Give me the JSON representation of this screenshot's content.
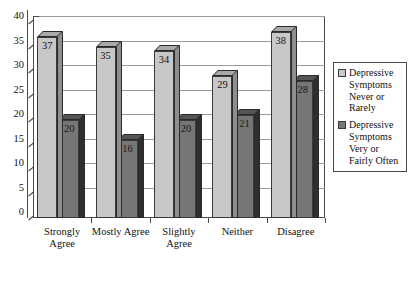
{
  "chart_data": {
    "type": "bar",
    "title": "",
    "subtitle": "",
    "xlabel": "",
    "ylabel": "",
    "ylim": [
      0,
      40
    ],
    "ytick_step": 5,
    "yticks": [
      "0",
      "5",
      "10",
      "15",
      "20",
      "25",
      "30",
      "35",
      "40"
    ],
    "grid": true,
    "legend_position": "right",
    "style": "3d-column",
    "categories": [
      "Strongly Agree",
      "Mostly Agree",
      "Slightly Agree",
      "Neither",
      "Disagree"
    ],
    "category_lines": [
      [
        "Strongly",
        "Agree"
      ],
      [
        "Mostly Agree"
      ],
      [
        "Slightly",
        "Agree"
      ],
      [
        "Neither"
      ],
      [
        "Disagree"
      ]
    ],
    "series": [
      {
        "name": "Depressive Symptoms Never or Rarely",
        "color": "#c8c8c8",
        "values": [
          37,
          35,
          34,
          29,
          38
        ]
      },
      {
        "name": "Depressive Symptoms Very or Fairly Often",
        "color": "#767676",
        "values": [
          20,
          16,
          20,
          21,
          28
        ]
      }
    ]
  },
  "legend": {
    "items": [
      {
        "label": "Depressive Symptoms Never or Rarely",
        "color": "#c8c8c8"
      },
      {
        "label": "Depressive Symptoms Very or Fairly Often",
        "color": "#767676"
      }
    ]
  }
}
